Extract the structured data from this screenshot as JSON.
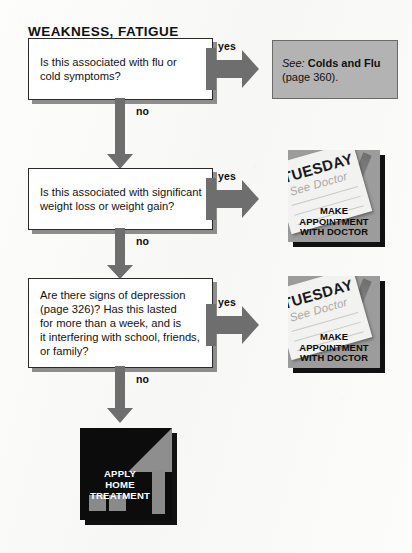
{
  "page": {
    "title": "WEAKNESS, FATIGUE",
    "background_color": "#fbfbfa"
  },
  "colors": {
    "box_fill": "#ffffff",
    "box_border": "#2b2b2b",
    "box_shadow": "#8d8d8d",
    "arrow": "#6e6e6e",
    "reference_box_fill": "#b3b3b3",
    "reference_box_border": "#6a6a6a",
    "illustration_fill": "#9c9c9c",
    "home_fill": "#0c0c0c",
    "text": "#121212"
  },
  "decisions": [
    {
      "id": "flu-or-cold-symptoms",
      "question": "Is this associated with flu or\ncold symptoms?",
      "yes_label": "yes",
      "no_label": "no"
    },
    {
      "id": "weight-loss-or-gain",
      "question": "Is this associated with significant\nweight loss or weight gain?",
      "yes_label": "yes",
      "no_label": "no"
    },
    {
      "id": "signs-of-depression",
      "question": "Are there signs of depression\n(page 326)?  Has this lasted\nfor more than a week, and is\nit interfering with school, friends,\nor family?",
      "yes_label": "yes",
      "no_label": "no"
    }
  ],
  "reference_box": {
    "see_label": "See:",
    "topic": "Colds and Flu",
    "page_note": "(page 360)."
  },
  "doctor_illustration": {
    "calendar_day": "TUESDAY",
    "calendar_note": "See Doctor",
    "caption_line1": "MAKE",
    "caption_line2": "APPOINTMENT",
    "caption_line3": "WITH DOCTOR"
  },
  "home_illustration": {
    "caption_line1": "APPLY",
    "caption_line2": "HOME",
    "caption_line3": "TREATMENT"
  }
}
